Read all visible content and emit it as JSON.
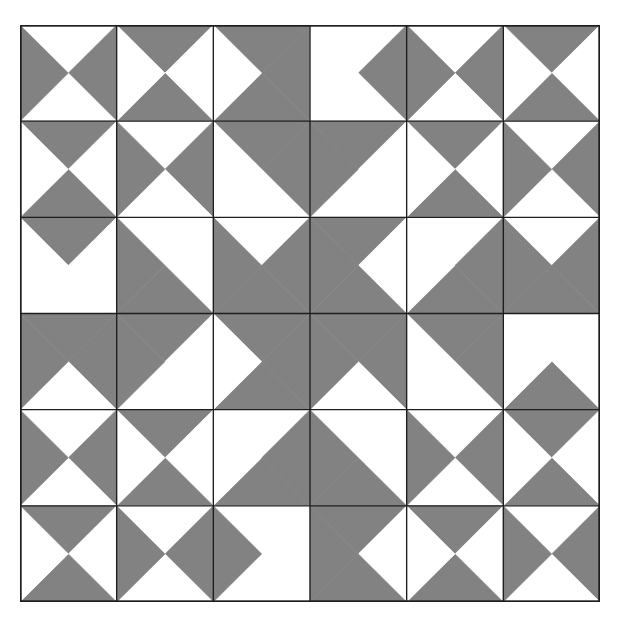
{
  "pattern": {
    "rows": 6,
    "cols": 6,
    "colors": {
      "dark": "#828282",
      "light": "#ffffff",
      "line": "#1e1e1e",
      "background": "#ffffff"
    },
    "legend": "Each cell is split by both diagonals into four triangles: T (top), R (right), B (bottom), L (left). 1 = gray, 0 = white.",
    "cells": [
      [
        {
          "T": 0,
          "R": 1,
          "B": 0,
          "L": 1
        },
        {
          "T": 1,
          "R": 0,
          "B": 1,
          "L": 0
        },
        {
          "T": 1,
          "R": 1,
          "B": 1,
          "L": 0
        },
        {
          "T": 0,
          "R": 1,
          "B": 0,
          "L": 0
        },
        {
          "T": 0,
          "R": 1,
          "B": 0,
          "L": 1
        },
        {
          "T": 1,
          "R": 0,
          "B": 1,
          "L": 0
        }
      ],
      [
        {
          "T": 1,
          "R": 0,
          "B": 1,
          "L": 0
        },
        {
          "T": 0,
          "R": 1,
          "B": 0,
          "L": 1
        },
        {
          "T": 1,
          "R": 1,
          "B": 0,
          "L": 0
        },
        {
          "T": 1,
          "R": 0,
          "B": 0,
          "L": 1
        },
        {
          "T": 1,
          "R": 0,
          "B": 1,
          "L": 0
        },
        {
          "T": 0,
          "R": 1,
          "B": 0,
          "L": 1
        }
      ],
      [
        {
          "T": 1,
          "R": 0,
          "B": 0,
          "L": 0
        },
        {
          "T": 0,
          "R": 0,
          "B": 1,
          "L": 1
        },
        {
          "T": 0,
          "R": 1,
          "B": 1,
          "L": 1
        },
        {
          "T": 1,
          "R": 0,
          "B": 1,
          "L": 1
        },
        {
          "T": 0,
          "R": 1,
          "B": 1,
          "L": 0
        },
        {
          "T": 0,
          "R": 1,
          "B": 1,
          "L": 1
        }
      ],
      [
        {
          "T": 1,
          "R": 1,
          "B": 0,
          "L": 1
        },
        {
          "T": 1,
          "R": 0,
          "B": 0,
          "L": 1
        },
        {
          "T": 1,
          "R": 1,
          "B": 1,
          "L": 0
        },
        {
          "T": 1,
          "R": 1,
          "B": 0,
          "L": 1
        },
        {
          "T": 1,
          "R": 1,
          "B": 0,
          "L": 0
        },
        {
          "T": 0,
          "R": 0,
          "B": 1,
          "L": 0
        }
      ],
      [
        {
          "T": 0,
          "R": 1,
          "B": 0,
          "L": 1
        },
        {
          "T": 1,
          "R": 0,
          "B": 1,
          "L": 0
        },
        {
          "T": 0,
          "R": 1,
          "B": 1,
          "L": 0
        },
        {
          "T": 0,
          "R": 0,
          "B": 1,
          "L": 1
        },
        {
          "T": 0,
          "R": 1,
          "B": 0,
          "L": 1
        },
        {
          "T": 1,
          "R": 0,
          "B": 1,
          "L": 0
        }
      ],
      [
        {
          "T": 1,
          "R": 0,
          "B": 1,
          "L": 0
        },
        {
          "T": 0,
          "R": 1,
          "B": 0,
          "L": 1
        },
        {
          "T": 0,
          "R": 0,
          "B": 0,
          "L": 1
        },
        {
          "T": 1,
          "R": 0,
          "B": 1,
          "L": 1
        },
        {
          "T": 1,
          "R": 0,
          "B": 1,
          "L": 0
        },
        {
          "T": 0,
          "R": 1,
          "B": 0,
          "L": 1
        }
      ]
    ]
  }
}
